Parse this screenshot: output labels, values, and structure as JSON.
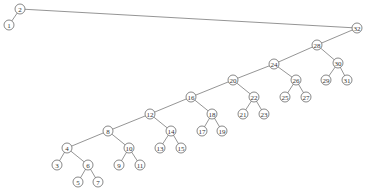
{
  "diagram": {
    "type": "binary-tree",
    "node_radius": 5,
    "colors": {
      "edge": "#7a7a7a",
      "node_stroke": "#6a6a6a",
      "node_fill": "#ffffff",
      "label": "#333333"
    },
    "nodes": [
      {
        "id": "2",
        "label": "2",
        "x": 20,
        "y": 9
      },
      {
        "id": "1",
        "label": "1",
        "x": 9,
        "y": 25
      },
      {
        "id": "32",
        "label": "32",
        "x": 357,
        "y": 28
      },
      {
        "id": "28",
        "label": "28",
        "x": 317,
        "y": 45
      },
      {
        "id": "24",
        "label": "24",
        "x": 274,
        "y": 64
      },
      {
        "id": "30",
        "label": "30",
        "x": 338,
        "y": 63
      },
      {
        "id": "29",
        "label": "29",
        "x": 326,
        "y": 80
      },
      {
        "id": "31",
        "label": "31",
        "x": 347,
        "y": 80
      },
      {
        "id": "26",
        "label": "26",
        "x": 296,
        "y": 80
      },
      {
        "id": "25",
        "label": "25",
        "x": 285,
        "y": 97
      },
      {
        "id": "27",
        "label": "27",
        "x": 306,
        "y": 97
      },
      {
        "id": "20",
        "label": "20",
        "x": 233,
        "y": 80
      },
      {
        "id": "22",
        "label": "22",
        "x": 254,
        "y": 97
      },
      {
        "id": "21",
        "label": "21",
        "x": 243,
        "y": 114
      },
      {
        "id": "23",
        "label": "23",
        "x": 264,
        "y": 114
      },
      {
        "id": "16",
        "label": "16",
        "x": 191,
        "y": 97
      },
      {
        "id": "18",
        "label": "18",
        "x": 212,
        "y": 114
      },
      {
        "id": "17",
        "label": "17",
        "x": 202,
        "y": 131
      },
      {
        "id": "19",
        "label": "19",
        "x": 222,
        "y": 131
      },
      {
        "id": "12",
        "label": "12",
        "x": 150,
        "y": 114
      },
      {
        "id": "14",
        "label": "14",
        "x": 171,
        "y": 131
      },
      {
        "id": "13",
        "label": "13",
        "x": 160,
        "y": 148
      },
      {
        "id": "15",
        "label": "15",
        "x": 181,
        "y": 148
      },
      {
        "id": "8",
        "label": "8",
        "x": 108,
        "y": 131
      },
      {
        "id": "10",
        "label": "10",
        "x": 129,
        "y": 148
      },
      {
        "id": "9",
        "label": "9",
        "x": 119,
        "y": 165
      },
      {
        "id": "11",
        "label": "11",
        "x": 140,
        "y": 165
      },
      {
        "id": "4",
        "label": "4",
        "x": 67,
        "y": 148
      },
      {
        "id": "6",
        "label": "6",
        "x": 88,
        "y": 165
      },
      {
        "id": "3",
        "label": "3",
        "x": 57,
        "y": 165
      },
      {
        "id": "5",
        "label": "5",
        "x": 78,
        "y": 182
      },
      {
        "id": "7",
        "label": "7",
        "x": 98,
        "y": 182
      }
    ],
    "edges": [
      [
        "2",
        "1"
      ],
      [
        "2",
        "32"
      ],
      [
        "32",
        "28"
      ],
      [
        "28",
        "24"
      ],
      [
        "28",
        "30"
      ],
      [
        "30",
        "29"
      ],
      [
        "30",
        "31"
      ],
      [
        "24",
        "20"
      ],
      [
        "24",
        "26"
      ],
      [
        "26",
        "25"
      ],
      [
        "26",
        "27"
      ],
      [
        "20",
        "16"
      ],
      [
        "20",
        "22"
      ],
      [
        "22",
        "21"
      ],
      [
        "22",
        "23"
      ],
      [
        "16",
        "12"
      ],
      [
        "16",
        "18"
      ],
      [
        "18",
        "17"
      ],
      [
        "18",
        "19"
      ],
      [
        "12",
        "8"
      ],
      [
        "12",
        "14"
      ],
      [
        "14",
        "13"
      ],
      [
        "14",
        "15"
      ],
      [
        "8",
        "4"
      ],
      [
        "8",
        "10"
      ],
      [
        "10",
        "9"
      ],
      [
        "10",
        "11"
      ],
      [
        "4",
        "3"
      ],
      [
        "4",
        "6"
      ],
      [
        "6",
        "5"
      ],
      [
        "6",
        "7"
      ]
    ]
  }
}
